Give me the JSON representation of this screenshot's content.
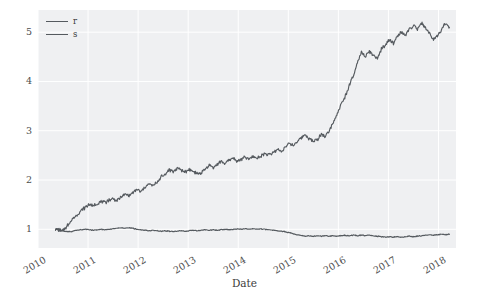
{
  "chart_data": {
    "type": "line",
    "title": "",
    "xlabel": "Date",
    "ylabel": "",
    "grid": true,
    "legend_position": "upper-left",
    "xlim": [
      2010.0,
      2018.35
    ],
    "ylim": [
      0.62,
      5.45
    ],
    "xticks": [
      "2010",
      "2011",
      "2012",
      "2013",
      "2014",
      "2015",
      "2016",
      "2017",
      "2018"
    ],
    "xtick_values": [
      2010,
      2011,
      2012,
      2013,
      2014,
      2015,
      2016,
      2017,
      2018
    ],
    "yticks": [
      "1",
      "2",
      "3",
      "4",
      "5"
    ],
    "ytick_values": [
      1,
      2,
      3,
      4,
      5
    ],
    "colors": {
      "plot_background": "#eff0f2",
      "figure_background": "#ffffff",
      "gridline": "#ffffff",
      "series_r": "#555a5f",
      "series_s": "#555a5f",
      "tick_label": "#4d4d4d"
    },
    "series": [
      {
        "name": "r",
        "x": [
          2010.35,
          2010.42,
          2010.48,
          2010.55,
          2010.62,
          2010.7,
          2010.78,
          2010.86,
          2010.94,
          2011.02,
          2011.1,
          2011.18,
          2011.26,
          2011.34,
          2011.42,
          2011.5,
          2011.58,
          2011.66,
          2011.74,
          2011.82,
          2011.9,
          2011.98,
          2012.06,
          2012.14,
          2012.22,
          2012.3,
          2012.38,
          2012.46,
          2012.54,
          2012.62,
          2012.7,
          2012.78,
          2012.86,
          2012.94,
          2013.02,
          2013.1,
          2013.18,
          2013.26,
          2013.34,
          2013.42,
          2013.5,
          2013.58,
          2013.66,
          2013.74,
          2013.82,
          2013.9,
          2013.98,
          2014.06,
          2014.14,
          2014.22,
          2014.3,
          2014.38,
          2014.46,
          2014.54,
          2014.62,
          2014.7,
          2014.78,
          2014.86,
          2014.94,
          2015.02,
          2015.1,
          2015.18,
          2015.26,
          2015.34,
          2015.42,
          2015.5,
          2015.58,
          2015.66,
          2015.74,
          2015.82,
          2015.9,
          2015.98,
          2016.06,
          2016.14,
          2016.22,
          2016.3,
          2016.38,
          2016.46,
          2016.54,
          2016.62,
          2016.7,
          2016.78,
          2016.86,
          2016.94,
          2017.02,
          2017.1,
          2017.18,
          2017.26,
          2017.34,
          2017.42,
          2017.5,
          2017.58,
          2017.66,
          2017.74,
          2017.82,
          2017.9,
          2017.98,
          2018.06,
          2018.14,
          2018.22
        ],
        "y": [
          1.0,
          0.99,
          0.97,
          1.03,
          1.12,
          1.22,
          1.3,
          1.38,
          1.44,
          1.5,
          1.47,
          1.52,
          1.56,
          1.54,
          1.6,
          1.62,
          1.58,
          1.66,
          1.7,
          1.68,
          1.74,
          1.8,
          1.76,
          1.86,
          1.92,
          1.88,
          1.96,
          2.06,
          2.12,
          2.21,
          2.17,
          2.24,
          2.2,
          2.16,
          2.22,
          2.18,
          2.12,
          2.15,
          2.22,
          2.3,
          2.26,
          2.32,
          2.38,
          2.34,
          2.4,
          2.44,
          2.38,
          2.42,
          2.46,
          2.42,
          2.48,
          2.44,
          2.5,
          2.54,
          2.5,
          2.56,
          2.62,
          2.58,
          2.66,
          2.74,
          2.7,
          2.78,
          2.86,
          2.92,
          2.84,
          2.78,
          2.82,
          2.94,
          2.88,
          3.02,
          3.18,
          3.36,
          3.54,
          3.7,
          3.92,
          4.12,
          4.36,
          4.6,
          4.48,
          4.62,
          4.52,
          4.46,
          4.66,
          4.74,
          4.84,
          4.78,
          4.92,
          5.0,
          4.94,
          5.06,
          5.12,
          5.06,
          5.18,
          5.1,
          4.96,
          4.86,
          4.92,
          5.06,
          5.18,
          5.1
        ]
      },
      {
        "name": "s",
        "x": [
          2010.35,
          2010.42,
          2010.48,
          2010.55,
          2010.62,
          2010.7,
          2010.78,
          2010.86,
          2010.94,
          2011.02,
          2011.1,
          2011.18,
          2011.26,
          2011.34,
          2011.42,
          2011.5,
          2011.58,
          2011.66,
          2011.74,
          2011.82,
          2011.9,
          2011.98,
          2012.06,
          2012.14,
          2012.22,
          2012.3,
          2012.38,
          2012.46,
          2012.54,
          2012.62,
          2012.7,
          2012.78,
          2012.86,
          2012.94,
          2013.02,
          2013.1,
          2013.18,
          2013.26,
          2013.34,
          2013.42,
          2013.5,
          2013.58,
          2013.66,
          2013.74,
          2013.82,
          2013.9,
          2013.98,
          2014.06,
          2014.14,
          2014.22,
          2014.3,
          2014.38,
          2014.46,
          2014.54,
          2014.62,
          2014.7,
          2014.78,
          2014.86,
          2014.94,
          2015.02,
          2015.1,
          2015.18,
          2015.26,
          2015.34,
          2015.42,
          2015.5,
          2015.58,
          2015.66,
          2015.74,
          2015.82,
          2015.9,
          2015.98,
          2016.06,
          2016.14,
          2016.22,
          2016.3,
          2016.38,
          2016.46,
          2016.54,
          2016.62,
          2016.7,
          2016.78,
          2016.86,
          2016.94,
          2017.02,
          2017.1,
          2017.18,
          2017.26,
          2017.34,
          2017.42,
          2017.5,
          2017.58,
          2017.66,
          2017.74,
          2017.82,
          2017.9,
          2017.98,
          2018.06,
          2018.14,
          2018.22
        ],
        "y": [
          1.0,
          0.99,
          0.97,
          0.96,
          0.95,
          0.96,
          0.98,
          0.99,
          1.0,
          0.99,
          0.98,
          0.99,
          1.0,
          0.99,
          1.0,
          1.01,
          1.02,
          1.03,
          1.02,
          1.03,
          1.02,
          1.0,
          0.99,
          0.98,
          0.97,
          0.98,
          0.97,
          0.96,
          0.97,
          0.96,
          0.95,
          0.96,
          0.97,
          0.96,
          0.97,
          0.98,
          0.97,
          0.98,
          0.99,
          0.98,
          0.99,
          0.98,
          0.99,
          1.0,
          0.99,
          1.0,
          1.01,
          1.0,
          1.01,
          1.0,
          1.01,
          1.0,
          1.01,
          1.0,
          0.99,
          0.98,
          0.97,
          0.96,
          0.95,
          0.93,
          0.91,
          0.89,
          0.87,
          0.86,
          0.87,
          0.86,
          0.87,
          0.86,
          0.87,
          0.86,
          0.87,
          0.86,
          0.87,
          0.88,
          0.87,
          0.88,
          0.87,
          0.88,
          0.87,
          0.88,
          0.87,
          0.86,
          0.85,
          0.84,
          0.85,
          0.84,
          0.85,
          0.84,
          0.85,
          0.86,
          0.85,
          0.86,
          0.87,
          0.88,
          0.89,
          0.88,
          0.89,
          0.9,
          0.89,
          0.9
        ]
      }
    ]
  },
  "legend": {
    "entries": [
      {
        "label": "r"
      },
      {
        "label": "s"
      }
    ]
  },
  "axis": {
    "xlabel": "Date"
  }
}
